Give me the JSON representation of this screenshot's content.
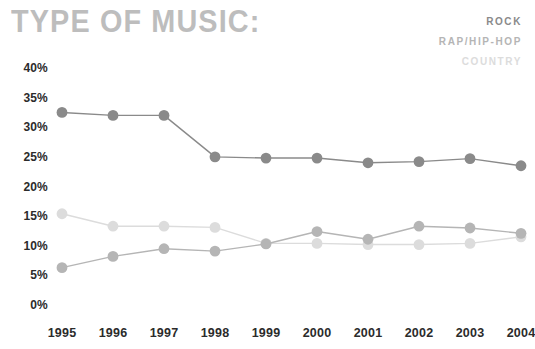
{
  "title": "TYPE OF MUSIC:",
  "legend": [
    {
      "label": "ROCK",
      "color": "#8a8a8a"
    },
    {
      "label": "RAP/HIP-HOP",
      "color": "#b5b5b5"
    },
    {
      "label": "COUNTRY",
      "color": "#dcdcdc"
    }
  ],
  "chart_data": {
    "type": "line",
    "title": "TYPE OF MUSIC:",
    "xlabel": "",
    "ylabel": "",
    "ylim": [
      0,
      40
    ],
    "ytick_labels": [
      "0%",
      "5%",
      "10%",
      "15%",
      "20%",
      "25%",
      "30%",
      "35%",
      "40%"
    ],
    "yticks": [
      0,
      5,
      10,
      15,
      20,
      25,
      30,
      35,
      40
    ],
    "grid": false,
    "legend_position": "top-right",
    "categories": [
      "1995",
      "1996",
      "1997",
      "1998",
      "1999",
      "2000",
      "2001",
      "2002",
      "2003",
      "2004"
    ],
    "x": [
      1995,
      1996,
      1997,
      1998,
      1999,
      2000,
      2001,
      2002,
      2003,
      2004
    ],
    "series": [
      {
        "name": "ROCK",
        "color": "#8a8a8a",
        "values": [
          32.5,
          32.0,
          32.0,
          25.0,
          24.8,
          24.8,
          24.0,
          24.2,
          24.7,
          23.5
        ]
      },
      {
        "name": "RAP/HIP-HOP",
        "color": "#b5b5b5",
        "values": [
          6.3,
          8.2,
          9.5,
          9.1,
          10.3,
          12.4,
          11.1,
          13.3,
          13.0,
          12.1
        ]
      },
      {
        "name": "COUNTRY",
        "color": "#dcdcdc",
        "values": [
          15.4,
          13.3,
          13.3,
          13.1,
          10.4,
          10.4,
          10.2,
          10.2,
          10.4,
          11.5
        ]
      }
    ]
  },
  "axes": {
    "y_tick_suffix": "%"
  }
}
